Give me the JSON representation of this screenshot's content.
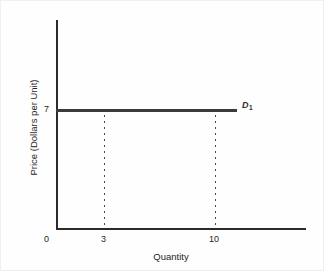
{
  "chart_data": {
    "type": "line",
    "title": "",
    "xlabel": "Quantity",
    "ylabel": "Price (Dollars per Unit)",
    "xlim": [
      0,
      22.5
    ],
    "ylim": [
      0,
      15
    ],
    "grid": false,
    "legend_position": "inline-right-of-line",
    "series": [
      {
        "name": "D1",
        "label": "D",
        "label_subscript": "1",
        "description": "Perfectly elastic (horizontal) demand curve at price 7",
        "x": [
          0,
          16
        ],
        "y": [
          7,
          7
        ],
        "color": "#3a3a3a"
      }
    ],
    "annotations": [
      {
        "name": "guide-quantity-3",
        "type": "dotted-vertical",
        "x": 3,
        "y_from": 0,
        "y_to": 7
      },
      {
        "name": "guide-quantity-10",
        "type": "dotted-vertical",
        "x": 10,
        "y_from": 0,
        "y_to": 7
      }
    ],
    "y_ticks": [
      {
        "value": 7,
        "label": "7"
      }
    ],
    "x_ticks": [
      {
        "value": 0,
        "label": "0"
      },
      {
        "value": 3,
        "label": "3"
      },
      {
        "value": 10,
        "label": "10"
      }
    ],
    "origin_label": "0",
    "axis_color": "#2b2b2b"
  },
  "labels": {
    "y_axis_title": "Price (Dollars per Unit)",
    "x_axis_title": "Quantity",
    "y_tick_7": "7",
    "x_tick_0": "0",
    "x_tick_3": "3",
    "x_tick_10": "10",
    "demand_curve": "D",
    "demand_curve_subscript": "1"
  }
}
